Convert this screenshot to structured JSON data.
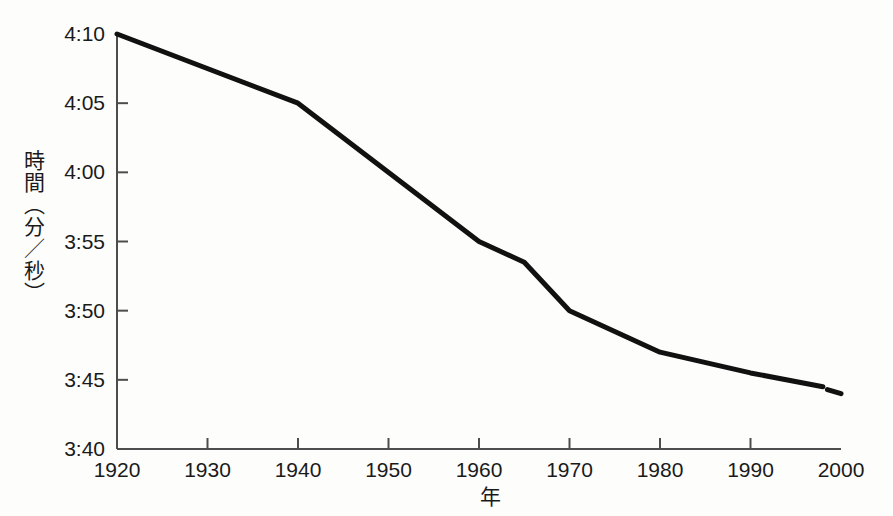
{
  "chart_data": {
    "type": "line",
    "title": "",
    "subtitle": "",
    "xlabel": "年",
    "ylabel": "時間（分／秒）",
    "x": [
      1920,
      1940,
      1960,
      1965,
      1970,
      1980,
      1990,
      1998,
      2000
    ],
    "values": [
      "4:10",
      "4:05",
      "3:55",
      "3:53.5",
      "3:50",
      "3:47",
      "3:45.5",
      "3:44.5",
      "3:44"
    ],
    "values_seconds": [
      250,
      245,
      235,
      233.5,
      230,
      227,
      225.5,
      224.5,
      224
    ],
    "series": [
      {
        "name": "マイル記録",
        "x": [
          1920,
          1940,
          1960,
          1965,
          1970,
          1980,
          1990,
          1998
        ],
        "values_seconds": [
          250,
          245,
          235,
          233.5,
          230,
          227,
          225.5,
          224.5
        ],
        "line_style": "solid"
      },
      {
        "name": "予測区間",
        "x": [
          1998.5,
          2000
        ],
        "values_seconds": [
          224.3,
          224.0
        ],
        "line_style": "dashed-tail"
      }
    ],
    "xlim": [
      1920,
      2000
    ],
    "ylim_seconds": [
      220,
      250
    ],
    "xticks": [
      1920,
      1930,
      1940,
      1950,
      1960,
      1970,
      1980,
      1990,
      2000
    ],
    "xtick_labels": [
      "1920",
      "1930",
      "1940",
      "1950",
      "1960",
      "1970",
      "1980",
      "1990",
      "2000"
    ],
    "yticks_seconds": [
      220,
      225,
      230,
      235,
      240,
      245,
      250
    ],
    "ytick_labels": [
      "3:40",
      "3:45",
      "3:50",
      "3:55",
      "4:00",
      "4:05",
      "4:10"
    ],
    "grid": false,
    "legend": "none",
    "line_color": "#111111",
    "axis_color": "#4d4d4d",
    "background_color": "#fdfdfc"
  },
  "axes": {
    "y_axis_name": "time-axis",
    "x_axis_name": "year-axis"
  }
}
